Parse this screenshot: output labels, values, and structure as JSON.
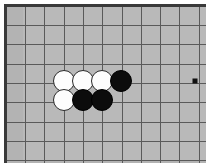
{
  "app": {
    "title": "Go Board Position",
    "type": "go-board"
  },
  "board": {
    "background_color": "#b9b9b9",
    "frame_color": "#3a3a3a",
    "line_color": "#5a5a5a",
    "grid_origin_x": 18,
    "grid_origin_y": 18,
    "grid_spacing": 19.3,
    "vertical_line_count": 10,
    "horizontal_line_count": 8,
    "stone_radius": 11
  },
  "star_points": [
    {
      "name": "hoshi-right",
      "x": 188,
      "y": 74,
      "color": "#111111"
    }
  ],
  "stones": [
    {
      "id": "stone-1",
      "color": "white",
      "color_hex": "#fdfdfd",
      "x": 57,
      "y": 74
    },
    {
      "id": "stone-2",
      "color": "white",
      "color_hex": "#fdfdfd",
      "x": 76,
      "y": 74
    },
    {
      "id": "stone-3",
      "color": "white",
      "color_hex": "#fdfdfd",
      "x": 95,
      "y": 74
    },
    {
      "id": "stone-4",
      "color": "black",
      "color_hex": "#0c0c0c",
      "x": 114,
      "y": 74
    },
    {
      "id": "stone-5",
      "color": "white",
      "color_hex": "#fdfdfd",
      "x": 57,
      "y": 93
    },
    {
      "id": "stone-6",
      "color": "black",
      "color_hex": "#0c0c0c",
      "x": 76,
      "y": 93
    },
    {
      "id": "stone-7",
      "color": "black",
      "color_hex": "#0c0c0c",
      "x": 95,
      "y": 93
    }
  ],
  "counts": {
    "white_stones": 4,
    "black_stones": 3,
    "total_stones": 7
  }
}
